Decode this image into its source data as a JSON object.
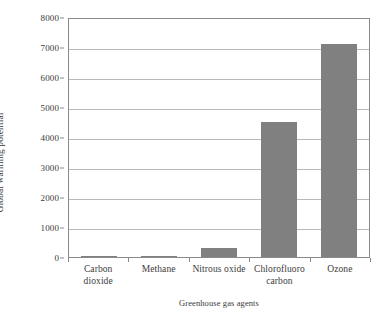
{
  "chart_data": {
    "type": "bar",
    "title": "",
    "xlabel": "Greenhouse gas agents",
    "ylabel": "Global warming potential",
    "categories": [
      "Carbon dioxide",
      "Methane",
      "Nitrous oxide",
      "Chlorofluoro carbon",
      "Ozone"
    ],
    "category_lines": [
      [
        "Carbon",
        "dioxide"
      ],
      [
        "Methane"
      ],
      [
        "Nitrous oxide"
      ],
      [
        "Chlorofluoro",
        "carbon"
      ],
      [
        "Ozone"
      ]
    ],
    "values": [
      1,
      25,
      310,
      4500,
      7100
    ],
    "ylim": [
      0,
      8000
    ],
    "yticks": [
      0,
      1000,
      2000,
      3000,
      4000,
      5000,
      6000,
      7000,
      8000
    ],
    "ytick_labels": [
      "0",
      "1000",
      "2000",
      "3000",
      "4000",
      "5000",
      "6000",
      "7000",
      "8000"
    ],
    "grid": true,
    "legend": "none",
    "bar_color": "#808080",
    "grid_color": "#b9b9b9",
    "axis_color": "#8a8a8a",
    "background_color": "#ffffff"
  }
}
